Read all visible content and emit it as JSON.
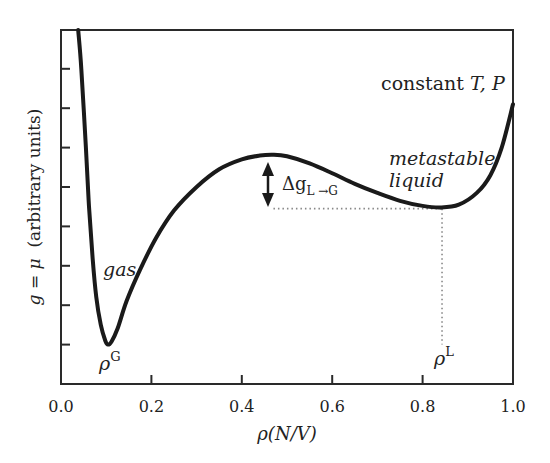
{
  "chart_data": {
    "type": "line",
    "title": "",
    "xlabel": "ρ(N/V)",
    "ylabel": "g = μ (arbitrary units)",
    "xlim": [
      0.0,
      1.0
    ],
    "ylim": [
      0,
      9
    ],
    "grid": false,
    "legend": null,
    "x_ticks": [
      0.0,
      0.2,
      0.4,
      0.6,
      0.8,
      1.0
    ],
    "x_tick_labels": [
      "0.0",
      "0.2",
      "0.4",
      "0.6",
      "0.8",
      "1.0"
    ],
    "y_ticks": [
      1,
      2,
      3,
      4,
      5,
      6,
      7,
      8
    ],
    "y_tick_labels": [],
    "series": [
      {
        "name": "g(ρ)",
        "color": "#1a1a1a",
        "x": [
          0.038,
          0.045,
          0.055,
          0.062,
          0.07,
          0.078,
          0.088,
          0.098,
          0.104,
          0.112,
          0.125,
          0.145,
          0.175,
          0.21,
          0.25,
          0.3,
          0.35,
          0.4,
          0.44,
          0.47,
          0.5,
          0.55,
          0.6,
          0.65,
          0.7,
          0.75,
          0.8,
          0.84,
          0.88,
          0.92,
          0.95,
          0.975,
          1.0
        ],
        "y": [
          9.0,
          8.0,
          6.0,
          4.5,
          3.2,
          2.2,
          1.5,
          1.1,
          1.0,
          1.08,
          1.4,
          2.1,
          2.9,
          3.7,
          4.4,
          5.0,
          5.45,
          5.7,
          5.8,
          5.82,
          5.78,
          5.6,
          5.35,
          5.08,
          4.85,
          4.65,
          4.52,
          4.48,
          4.55,
          4.85,
          5.3,
          6.0,
          7.1
        ]
      }
    ],
    "annotations": [
      {
        "text": "constant T, P",
        "x": 0.85,
        "y": 8.2
      },
      {
        "text": "metastable liquid",
        "x": 0.84,
        "y": 5.3
      },
      {
        "text": "gas",
        "x": 0.14,
        "y": 2.7
      },
      {
        "text": "ρ^G",
        "x": 0.11,
        "y": 0.55,
        "marks": "gas-phase minimum"
      },
      {
        "text": "ρ^L",
        "x": 0.84,
        "y": 0.6,
        "marks": "liquid-phase minimum"
      },
      {
        "text": "Δg_L→G",
        "x": 0.47,
        "y": 5.2,
        "marks": "double arrow from barrier max (5.8) to liquid min level (4.48)"
      }
    ],
    "reference_lines": [
      {
        "type": "horizontal",
        "style": "dotted",
        "y": 4.45,
        "x_from": 0.47,
        "x_to": 0.843
      },
      {
        "type": "vertical",
        "style": "dotted",
        "x": 0.843,
        "y_from": 4.45,
        "y_to": 1.0
      }
    ]
  },
  "labels": {
    "constant_prefix": "constant ",
    "constant_vars": "T, P",
    "metastable_line1": "metastable",
    "metastable_line2": "liquid",
    "gas": "gas",
    "rho_g_base": "ρ",
    "rho_g_sup": "G",
    "rho_l_base": "ρ",
    "rho_l_sup": "L",
    "delta_g": "Δg",
    "delta_g_sub": "L →G",
    "xlabel_rho": "ρ",
    "xlabel_rest": "(N/V)",
    "ylabel_g": "g",
    "ylabel_eq": " = ",
    "ylabel_mu": "μ",
    "ylabel_rest": "  (arbitrary units)"
  }
}
